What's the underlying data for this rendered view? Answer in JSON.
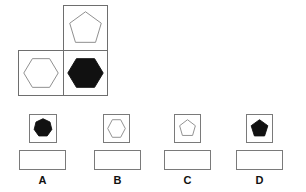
{
  "puzzle": {
    "grid": [
      {
        "position": "top-right",
        "shape": "pentagon",
        "fill": "outline"
      },
      {
        "position": "bottom-left",
        "shape": "hexagon",
        "fill": "outline"
      },
      {
        "position": "bottom-right",
        "shape": "hexagon",
        "fill": "filled"
      }
    ]
  },
  "options": [
    {
      "label": "A",
      "shape": "heptagon",
      "fill": "filled"
    },
    {
      "label": "B",
      "shape": "hexagon",
      "fill": "outline"
    },
    {
      "label": "C",
      "shape": "pentagon",
      "fill": "outline"
    },
    {
      "label": "D",
      "shape": "pentagon",
      "fill": "filled"
    }
  ],
  "colors": {
    "fill": "#111111",
    "stroke": "#888888",
    "border": "#6e6e6e"
  }
}
